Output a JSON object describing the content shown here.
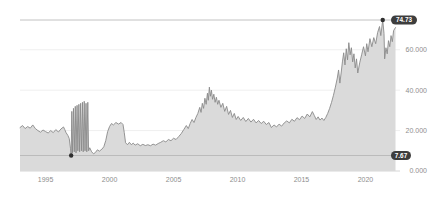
{
  "panel": {
    "type": "price-history-chart",
    "background": "#ffffff"
  },
  "chart_data": {
    "type": "area",
    "title": "",
    "xlabel": "",
    "ylabel": "",
    "legend": "none",
    "grid": "faint horizontal gridlines",
    "xlim": [
      1993.0,
      2022.7
    ],
    "ylim": [
      0,
      80
    ],
    "x_axis": {
      "ticks": [
        {
          "value": 1995,
          "label": "1995"
        },
        {
          "value": 2000,
          "label": "2000"
        },
        {
          "value": 2005,
          "label": "2005"
        },
        {
          "value": 2010,
          "label": "2010"
        },
        {
          "value": 2015,
          "label": "2015"
        },
        {
          "value": 2020,
          "label": "2020"
        }
      ]
    },
    "y_axis": {
      "side": "right",
      "ticks": [
        {
          "value": 0,
          "label": "0.000"
        },
        {
          "value": 20,
          "label": "20.000"
        },
        {
          "value": 40,
          "label": "40.000"
        },
        {
          "value": 60,
          "label": "60.000"
        }
      ]
    },
    "markers": {
      "max": {
        "year": 2021.35,
        "value": 74.73,
        "label": "74.73"
      },
      "min": {
        "year": 1997.0,
        "value": 7.67,
        "label": "7.67"
      }
    },
    "series": [
      {
        "name": "price",
        "points": [
          [
            1993.0,
            21.5
          ],
          [
            1993.2,
            22.5
          ],
          [
            1993.4,
            21.0
          ],
          [
            1993.6,
            22.0
          ],
          [
            1993.8,
            21.2
          ],
          [
            1994.0,
            22.8
          ],
          [
            1994.2,
            21.0
          ],
          [
            1994.4,
            20.0
          ],
          [
            1994.6,
            19.2
          ],
          [
            1994.8,
            20.3
          ],
          [
            1995.0,
            19.5
          ],
          [
            1995.2,
            18.8
          ],
          [
            1995.4,
            20.0
          ],
          [
            1995.6,
            19.0
          ],
          [
            1995.8,
            20.5
          ],
          [
            1996.0,
            19.3
          ],
          [
            1996.2,
            20.8
          ],
          [
            1996.4,
            21.8
          ],
          [
            1996.5,
            20.5
          ],
          [
            1996.6,
            19.0
          ],
          [
            1996.75,
            17.5
          ],
          [
            1996.85,
            16.0
          ],
          [
            1996.95,
            11.0
          ],
          [
            1997.0,
            7.67
          ],
          [
            1997.05,
            29.5
          ],
          [
            1997.1,
            9.0
          ],
          [
            1997.18,
            31.0
          ],
          [
            1997.24,
            9.5
          ],
          [
            1997.32,
            32.0
          ],
          [
            1997.38,
            9.0
          ],
          [
            1997.46,
            32.5
          ],
          [
            1997.52,
            10.0
          ],
          [
            1997.6,
            33.0
          ],
          [
            1997.66,
            9.5
          ],
          [
            1997.74,
            33.5
          ],
          [
            1997.8,
            10.0
          ],
          [
            1997.88,
            34.0
          ],
          [
            1997.94,
            9.5
          ],
          [
            1998.02,
            34.5
          ],
          [
            1998.08,
            10.0
          ],
          [
            1998.16,
            33.5
          ],
          [
            1998.22,
            9.5
          ],
          [
            1998.3,
            34.0
          ],
          [
            1998.36,
            10.0
          ],
          [
            1998.45,
            11.5
          ],
          [
            1998.6,
            9.5
          ],
          [
            1998.75,
            8.5
          ],
          [
            1998.9,
            9.2
          ],
          [
            1999.05,
            10.5
          ],
          [
            1999.2,
            9.8
          ],
          [
            1999.4,
            10.8
          ],
          [
            1999.55,
            12.0
          ],
          [
            1999.7,
            15.0
          ],
          [
            1999.85,
            19.5
          ],
          [
            2000.0,
            22.0
          ],
          [
            2000.15,
            23.5
          ],
          [
            2000.3,
            22.8
          ],
          [
            2000.5,
            24.0
          ],
          [
            2000.7,
            23.2
          ],
          [
            2000.9,
            24.0
          ],
          [
            2001.05,
            23.0
          ],
          [
            2001.15,
            19.0
          ],
          [
            2001.25,
            14.0
          ],
          [
            2001.4,
            13.0
          ],
          [
            2001.55,
            14.2
          ],
          [
            2001.7,
            13.0
          ],
          [
            2001.85,
            13.8
          ],
          [
            2002.0,
            12.8
          ],
          [
            2002.2,
            13.5
          ],
          [
            2002.4,
            12.5
          ],
          [
            2002.6,
            13.2
          ],
          [
            2002.8,
            12.6
          ],
          [
            2003.0,
            13.0
          ],
          [
            2003.2,
            12.5
          ],
          [
            2003.4,
            13.3
          ],
          [
            2003.6,
            12.8
          ],
          [
            2003.8,
            13.6
          ],
          [
            2004.0,
            14.2
          ],
          [
            2004.2,
            15.0
          ],
          [
            2004.4,
            14.4
          ],
          [
            2004.6,
            15.6
          ],
          [
            2004.8,
            15.0
          ],
          [
            2005.0,
            16.2
          ],
          [
            2005.2,
            15.6
          ],
          [
            2005.4,
            17.0
          ],
          [
            2005.6,
            18.5
          ],
          [
            2005.8,
            20.5
          ],
          [
            2006.0,
            22.5
          ],
          [
            2006.15,
            21.0
          ],
          [
            2006.3,
            23.5
          ],
          [
            2006.45,
            25.5
          ],
          [
            2006.6,
            24.0
          ],
          [
            2006.75,
            26.5
          ],
          [
            2006.9,
            28.5
          ],
          [
            2007.05,
            31.5
          ],
          [
            2007.15,
            29.0
          ],
          [
            2007.25,
            33.5
          ],
          [
            2007.35,
            31.0
          ],
          [
            2007.45,
            36.0
          ],
          [
            2007.55,
            33.0
          ],
          [
            2007.65,
            38.5
          ],
          [
            2007.72,
            35.0
          ],
          [
            2007.8,
            41.5
          ],
          [
            2007.88,
            37.0
          ],
          [
            2007.96,
            40.0
          ],
          [
            2008.05,
            35.5
          ],
          [
            2008.15,
            38.0
          ],
          [
            2008.25,
            34.0
          ],
          [
            2008.35,
            36.5
          ],
          [
            2008.45,
            33.0
          ],
          [
            2008.55,
            35.0
          ],
          [
            2008.7,
            31.5
          ],
          [
            2008.85,
            33.5
          ],
          [
            2009.0,
            29.5
          ],
          [
            2009.15,
            32.0
          ],
          [
            2009.3,
            28.0
          ],
          [
            2009.45,
            30.0
          ],
          [
            2009.6,
            26.5
          ],
          [
            2009.75,
            28.5
          ],
          [
            2009.9,
            25.5
          ],
          [
            2010.05,
            27.0
          ],
          [
            2010.25,
            25.0
          ],
          [
            2010.45,
            26.5
          ],
          [
            2010.65,
            24.5
          ],
          [
            2010.85,
            26.0
          ],
          [
            2011.05,
            24.2
          ],
          [
            2011.25,
            25.6
          ],
          [
            2011.45,
            23.8
          ],
          [
            2011.65,
            25.0
          ],
          [
            2011.85,
            23.5
          ],
          [
            2012.05,
            24.6
          ],
          [
            2012.25,
            23.0
          ],
          [
            2012.45,
            24.0
          ],
          [
            2012.65,
            21.5
          ],
          [
            2012.85,
            22.8
          ],
          [
            2013.05,
            21.8
          ],
          [
            2013.25,
            23.2
          ],
          [
            2013.45,
            22.2
          ],
          [
            2013.65,
            23.8
          ],
          [
            2013.85,
            24.8
          ],
          [
            2014.05,
            23.8
          ],
          [
            2014.25,
            25.6
          ],
          [
            2014.45,
            24.6
          ],
          [
            2014.65,
            26.4
          ],
          [
            2014.85,
            25.4
          ],
          [
            2015.05,
            27.2
          ],
          [
            2015.25,
            26.0
          ],
          [
            2015.45,
            28.2
          ],
          [
            2015.65,
            26.8
          ],
          [
            2015.85,
            29.4
          ],
          [
            2016.0,
            27.5
          ],
          [
            2016.15,
            25.5
          ],
          [
            2016.3,
            26.8
          ],
          [
            2016.45,
            25.2
          ],
          [
            2016.6,
            26.2
          ],
          [
            2016.75,
            25.0
          ],
          [
            2016.9,
            26.5
          ],
          [
            2017.05,
            28.5
          ],
          [
            2017.2,
            31.0
          ],
          [
            2017.35,
            34.0
          ],
          [
            2017.5,
            37.5
          ],
          [
            2017.65,
            41.5
          ],
          [
            2017.8,
            46.0
          ],
          [
            2017.9,
            50.0
          ],
          [
            2018.0,
            43.5
          ],
          [
            2018.1,
            48.5
          ],
          [
            2018.2,
            54.0
          ],
          [
            2018.3,
            58.5
          ],
          [
            2018.4,
            52.5
          ],
          [
            2018.5,
            60.5
          ],
          [
            2018.6,
            55.0
          ],
          [
            2018.7,
            63.5
          ],
          [
            2018.8,
            57.5
          ],
          [
            2018.9,
            61.0
          ],
          [
            2019.0,
            54.0
          ],
          [
            2019.1,
            58.0
          ],
          [
            2019.2,
            51.0
          ],
          [
            2019.3,
            55.5
          ],
          [
            2019.4,
            48.5
          ],
          [
            2019.55,
            53.5
          ],
          [
            2019.7,
            57.5
          ],
          [
            2019.85,
            61.5
          ],
          [
            2020.0,
            57.0
          ],
          [
            2020.1,
            63.0
          ],
          [
            2020.2,
            59.0
          ],
          [
            2020.35,
            65.5
          ],
          [
            2020.5,
            61.5
          ],
          [
            2020.65,
            66.0
          ],
          [
            2020.8,
            63.0
          ],
          [
            2020.95,
            68.5
          ],
          [
            2021.1,
            71.5
          ],
          [
            2021.2,
            67.0
          ],
          [
            2021.35,
            74.73
          ],
          [
            2021.45,
            68.0
          ],
          [
            2021.5,
            55.5
          ],
          [
            2021.6,
            61.0
          ],
          [
            2021.7,
            58.0
          ],
          [
            2021.8,
            64.5
          ],
          [
            2021.9,
            61.5
          ],
          [
            2022.0,
            67.0
          ],
          [
            2022.1,
            64.0
          ],
          [
            2022.2,
            69.5
          ],
          [
            2022.35,
            71.0
          ]
        ]
      }
    ],
    "colors": {
      "background": "#ffffff",
      "area_fill": "#dadada",
      "line": "#8a8a8a",
      "gridline": "#efefef",
      "axis_line": "#d6d6d6",
      "marker_line": "#b3b3b3",
      "marker_dot": "#2f2f2f",
      "badge_bg": "#3d3d3d",
      "badge_text": "#ffffff",
      "tick_text": "#8e8e8e"
    }
  }
}
